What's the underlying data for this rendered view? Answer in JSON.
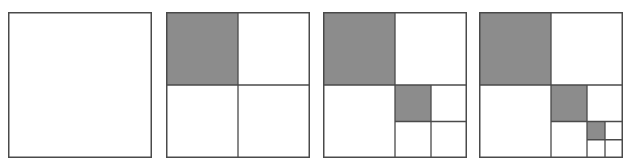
{
  "diagram": {
    "title": "",
    "colors": {
      "stroke": "#4a4a4a",
      "shaded": "#8c8c8c",
      "background": "#ffffff"
    },
    "panels": [
      {
        "id": 1,
        "left": 8,
        "depth": 0
      },
      {
        "id": 2,
        "left": 166,
        "depth": 1
      },
      {
        "id": 3,
        "left": 323,
        "depth": 2
      },
      {
        "id": 4,
        "left": 479,
        "depth": 3
      }
    ]
  }
}
